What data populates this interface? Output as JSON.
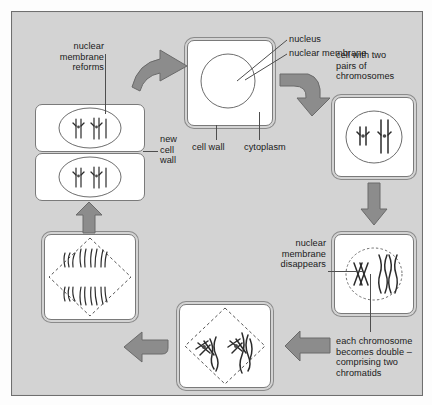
{
  "diagram": {
    "background_color": "#d3d3d3",
    "arrow_color": "#8c8c8c",
    "ink_color": "#2b2b2b"
  },
  "labels": {
    "nuclear_membrane_reforms": "nuclear\nmembrane\nreforms",
    "new_cell_wall": "new\ncell\nwall",
    "nucleus": "nucleus",
    "nuclear_membrane": "nuclear membrane",
    "cell_wall": "cell wall",
    "cytoplasm": "cytoplasm",
    "cell_with_two_pairs": "cell with two\npairs of\nchromosomes",
    "nuclear_membrane_disappears": "nuclear\nmembrane\ndisappears",
    "each_chromosome_doubles": "each chromosome\nbecomes double –\ncomprising two\nchromatids"
  },
  "stages": [
    {
      "id": "interphase-cell",
      "name": "plain cell with nucleus",
      "position": "top-center"
    },
    {
      "id": "cell-two-pairs-chromosomes",
      "name": "cell with two pairs of chromosomes",
      "position": "right-upper"
    },
    {
      "id": "chromosomes-doubled",
      "name": "each chromosome becomes double",
      "position": "right-lower"
    },
    {
      "id": "metaphase-anaphase",
      "name": "chromatids on spindle",
      "position": "bottom-center"
    },
    {
      "id": "anaphase-separation",
      "name": "chromatids pulled to poles",
      "position": "left-lower"
    },
    {
      "id": "two-daughter-cells",
      "name": "two daughter cells, new cell wall",
      "position": "left-upper"
    }
  ],
  "arrows": [
    {
      "id": "arrow-daughter-to-interphase",
      "direction": "right-curved"
    },
    {
      "id": "arrow-interphase-to-pairs",
      "direction": "right-curved-down"
    },
    {
      "id": "arrow-pairs-to-doubled",
      "direction": "down"
    },
    {
      "id": "arrow-doubled-to-spindle",
      "direction": "left"
    },
    {
      "id": "arrow-spindle-to-separation",
      "direction": "left-curved-up"
    },
    {
      "id": "arrow-separation-to-daughter",
      "direction": "up"
    }
  ]
}
